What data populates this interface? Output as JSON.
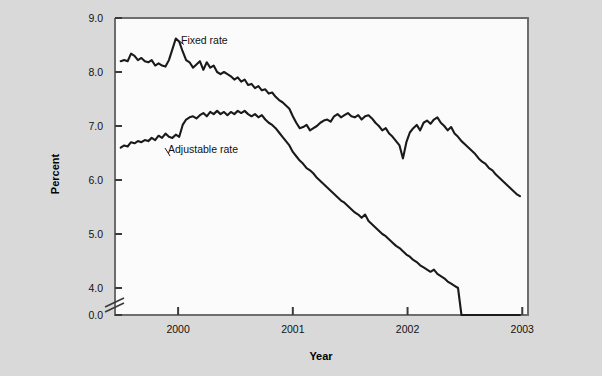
{
  "figure": {
    "background_color": "#d9d9d9",
    "plot_background_color": "#fbfbfb",
    "line_color": "#1a1a1a",
    "axis_color": "#6d6d6d"
  },
  "chart_data": {
    "type": "line",
    "title": "",
    "xlabel": "Year",
    "ylabel": "Percent",
    "grid": false,
    "legend_position": "inline-annotations",
    "axis_break": {
      "present": true,
      "between": [
        0.0,
        4.0
      ],
      "axis": "y"
    },
    "xlim": [
      1999.45,
      2003.05
    ],
    "ylim": [
      0.0,
      9.0
    ],
    "yticks": [
      "0.0",
      "4.0",
      "5.0",
      "6.0",
      "7.0",
      "8.0",
      "9.0"
    ],
    "ytick_values": [
      0.0,
      4.0,
      5.0,
      6.0,
      7.0,
      8.0,
      9.0
    ],
    "xticks": [
      "2000",
      "2001",
      "2002",
      "2003"
    ],
    "xtick_values": [
      2000,
      2001,
      2002,
      2003
    ],
    "annotations": [
      {
        "text": "Fixed rate",
        "x": 2000.05,
        "y": 8.62
      },
      {
        "text": "Adjustable rate",
        "x": 1999.93,
        "y": 6.48
      }
    ],
    "series": [
      {
        "name": "Fixed rate",
        "color": "#1a1a1a",
        "x": [
          1999.5,
          1999.53,
          1999.56,
          1999.59,
          1999.62,
          1999.65,
          1999.68,
          1999.71,
          1999.74,
          1999.77,
          1999.8,
          1999.83,
          1999.86,
          1999.89,
          1999.92,
          1999.95,
          1999.98,
          2000.01,
          2000.04,
          2000.07,
          2000.1,
          2000.13,
          2000.16,
          2000.19,
          2000.22,
          2000.25,
          2000.28,
          2000.31,
          2000.34,
          2000.37,
          2000.4,
          2000.43,
          2000.46,
          2000.49,
          2000.52,
          2000.55,
          2000.58,
          2000.61,
          2000.64,
          2000.67,
          2000.7,
          2000.73,
          2000.76,
          2000.79,
          2000.82,
          2000.85,
          2000.88,
          2000.91,
          2000.94,
          2000.97,
          2001.0,
          2001.03,
          2001.06,
          2001.09,
          2001.12,
          2001.15,
          2001.18,
          2001.21,
          2001.24,
          2001.27,
          2001.3,
          2001.33,
          2001.36,
          2001.39,
          2001.42,
          2001.45,
          2001.48,
          2001.51,
          2001.54,
          2001.57,
          2001.6,
          2001.63,
          2001.66,
          2001.69,
          2001.72,
          2001.75,
          2001.78,
          2001.81,
          2001.84,
          2001.87,
          2001.9,
          2001.93,
          2001.96,
          2001.99,
          2002.02,
          2002.05,
          2002.08,
          2002.11,
          2002.14,
          2002.17,
          2002.2,
          2002.23,
          2002.26,
          2002.29,
          2002.32,
          2002.35,
          2002.38,
          2002.41,
          2002.44,
          2002.47,
          2002.5,
          2002.53,
          2002.56,
          2002.59,
          2002.62,
          2002.65,
          2002.68,
          2002.71,
          2002.74,
          2002.77,
          2002.8,
          2002.83,
          2002.86,
          2002.89,
          2002.92,
          2002.95,
          2002.98
        ],
        "y": [
          8.2,
          8.22,
          8.2,
          8.34,
          8.3,
          8.22,
          8.26,
          8.2,
          8.18,
          8.22,
          8.12,
          8.16,
          8.12,
          8.1,
          8.22,
          8.42,
          8.62,
          8.56,
          8.38,
          8.22,
          8.18,
          8.08,
          8.14,
          8.2,
          8.04,
          8.18,
          8.08,
          8.12,
          8.0,
          7.96,
          8.0,
          7.96,
          7.92,
          7.86,
          7.9,
          7.82,
          7.86,
          7.76,
          7.78,
          7.7,
          7.74,
          7.66,
          7.68,
          7.6,
          7.62,
          7.54,
          7.48,
          7.44,
          7.38,
          7.32,
          7.18,
          7.06,
          6.96,
          6.98,
          7.02,
          6.92,
          6.96,
          7.0,
          7.06,
          7.1,
          7.12,
          7.08,
          7.18,
          7.22,
          7.16,
          7.2,
          7.24,
          7.18,
          7.16,
          7.2,
          7.12,
          7.18,
          7.2,
          7.14,
          7.06,
          7.0,
          6.92,
          6.96,
          6.86,
          6.8,
          6.72,
          6.64,
          6.4,
          6.7,
          6.88,
          6.96,
          7.02,
          6.92,
          7.06,
          7.1,
          7.04,
          7.12,
          7.16,
          7.06,
          7.0,
          6.92,
          6.98,
          6.86,
          6.8,
          6.72,
          6.66,
          6.6,
          6.54,
          6.48,
          6.4,
          6.34,
          6.3,
          6.22,
          6.18,
          6.1,
          6.04,
          5.98,
          5.92,
          5.86,
          5.8,
          5.74,
          5.7
        ]
      },
      {
        "name": "Adjustable rate",
        "color": "#1a1a1a",
        "x": [
          1999.5,
          1999.53,
          1999.56,
          1999.59,
          1999.62,
          1999.65,
          1999.68,
          1999.71,
          1999.74,
          1999.77,
          1999.8,
          1999.83,
          1999.86,
          1999.89,
          1999.92,
          1999.95,
          1999.98,
          2000.01,
          2000.04,
          2000.07,
          2000.1,
          2000.13,
          2000.16,
          2000.19,
          2000.22,
          2000.25,
          2000.28,
          2000.31,
          2000.34,
          2000.37,
          2000.4,
          2000.43,
          2000.46,
          2000.49,
          2000.52,
          2000.55,
          2000.58,
          2000.61,
          2000.64,
          2000.67,
          2000.7,
          2000.73,
          2000.76,
          2000.79,
          2000.82,
          2000.85,
          2000.88,
          2000.91,
          2000.94,
          2000.97,
          2001.0,
          2001.03,
          2001.06,
          2001.09,
          2001.12,
          2001.15,
          2001.18,
          2001.21,
          2001.24,
          2001.27,
          2001.3,
          2001.33,
          2001.36,
          2001.39,
          2001.42,
          2001.45,
          2001.48,
          2001.51,
          2001.54,
          2001.57,
          2001.6,
          2001.63,
          2001.66,
          2001.69,
          2001.72,
          2001.75,
          2001.78,
          2001.81,
          2001.84,
          2001.87,
          2001.9,
          2001.93,
          2001.96,
          2001.99,
          2002.02,
          2002.05,
          2002.08,
          2002.11,
          2002.14,
          2002.17,
          2002.2,
          2002.23,
          2002.26,
          2002.29,
          2002.32,
          2002.35,
          2002.38,
          2002.41,
          2002.44,
          2002.47,
          2002.5,
          2002.53,
          2002.56,
          2002.59,
          2002.62,
          2002.65,
          2002.68,
          2002.71,
          2002.74,
          2002.77,
          2002.8,
          2002.83,
          2002.86,
          2002.89,
          2002.92,
          2002.95,
          2002.98
        ],
        "y": [
          6.6,
          6.64,
          6.62,
          6.7,
          6.68,
          6.72,
          6.7,
          6.74,
          6.72,
          6.78,
          6.74,
          6.82,
          6.78,
          6.86,
          6.8,
          6.78,
          6.84,
          6.8,
          7.02,
          7.12,
          7.16,
          7.18,
          7.14,
          7.2,
          7.24,
          7.18,
          7.26,
          7.22,
          7.28,
          7.22,
          7.26,
          7.2,
          7.26,
          7.22,
          7.28,
          7.24,
          7.28,
          7.22,
          7.18,
          7.22,
          7.16,
          7.2,
          7.12,
          7.06,
          7.02,
          6.96,
          6.88,
          6.8,
          6.72,
          6.64,
          6.52,
          6.44,
          6.36,
          6.3,
          6.22,
          6.18,
          6.12,
          6.04,
          5.98,
          5.92,
          5.86,
          5.8,
          5.74,
          5.68,
          5.62,
          5.58,
          5.52,
          5.46,
          5.4,
          5.36,
          5.3,
          5.36,
          5.24,
          5.18,
          5.12,
          5.06,
          5.0,
          4.96,
          4.9,
          4.84,
          4.78,
          4.74,
          4.68,
          4.62,
          4.58,
          4.52,
          4.48,
          4.42,
          4.38,
          4.34,
          4.3,
          4.34,
          4.26,
          4.22,
          4.18,
          4.12,
          4.08,
          4.04,
          4.0,
          3.96,
          3.92,
          3.88,
          3.84,
          3.82,
          3.78,
          3.74,
          3.72,
          3.68,
          3.64,
          3.6,
          3.58,
          3.54,
          3.52,
          3.48,
          3.46,
          3.44,
          3.5
        ]
      }
    ]
  }
}
